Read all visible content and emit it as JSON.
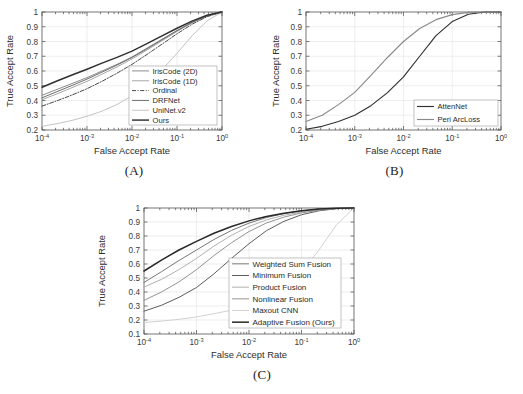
{
  "figure": {
    "name": "roc-curve-figure",
    "background": "#ffffff",
    "panel_count": 3
  },
  "axes_common": {
    "xlabel": "False Accept Rate",
    "ylabel": "True Accept Rate",
    "xticks": [
      "10-4",
      "10-3",
      "10-2",
      "10-1",
      "100"
    ],
    "xtick_mantissa": [
      "10",
      "10",
      "10",
      "10",
      "10"
    ],
    "xtick_exponent": [
      "-4",
      "-3",
      "-2",
      "-1",
      "0"
    ],
    "xlim": [
      0.0001,
      1
    ],
    "xscale": "log",
    "grid": true
  },
  "panels": [
    {
      "id": "A",
      "caption": "(A)"
    },
    {
      "id": "B",
      "caption": "(B)"
    },
    {
      "id": "C",
      "caption": "(C)"
    }
  ],
  "chart_data": [
    {
      "type": "line",
      "panel": "A",
      "title": "",
      "xlabel": "False Accept Rate",
      "ylabel": "True Accept Rate",
      "xscale": "log",
      "xlim": [
        0.0001,
        1
      ],
      "ylim": [
        0.2,
        1.0
      ],
      "yticks": [
        0.2,
        0.3,
        0.4,
        0.5,
        0.6,
        0.7,
        0.8,
        0.9,
        1
      ],
      "ytick_labels": [
        "0.2",
        "0.3",
        "0.4",
        "0.5",
        "0.6",
        "0.7",
        "0.8",
        "0.9",
        "1"
      ],
      "grid": true,
      "legend_position": "lower-right",
      "x": [
        0.0001,
        0.000215,
        0.000464,
        0.001,
        0.00215,
        0.00464,
        0.01,
        0.0215,
        0.0464,
        0.1,
        0.215,
        0.464,
        1.0
      ],
      "series": [
        {
          "name": "IrisCode (2D)",
          "color": "#8c8c8c",
          "dash": "none",
          "width": 1.0,
          "values": [
            0.435,
            0.475,
            0.515,
            0.555,
            0.6,
            0.645,
            0.695,
            0.755,
            0.815,
            0.875,
            0.93,
            0.975,
            1.0
          ]
        },
        {
          "name": "IrisCode (1D)",
          "color": "#a8a8a8",
          "dash": "none",
          "width": 1.0,
          "values": [
            0.405,
            0.445,
            0.487,
            0.53,
            0.578,
            0.628,
            0.682,
            0.742,
            0.805,
            0.868,
            0.927,
            0.973,
            1.0
          ]
        },
        {
          "name": "Ordinal",
          "color": "#4a4a4a",
          "dash": "dashdot",
          "width": 1.0,
          "values": [
            0.362,
            0.398,
            0.437,
            0.48,
            0.53,
            0.585,
            0.645,
            0.712,
            0.782,
            0.852,
            0.917,
            0.968,
            1.0
          ]
        },
        {
          "name": "DRFNet",
          "color": "#6e6e6e",
          "dash": "none",
          "width": 1.0,
          "values": [
            0.418,
            0.46,
            0.502,
            0.545,
            0.592,
            0.64,
            0.692,
            0.75,
            0.812,
            0.873,
            0.929,
            0.974,
            1.0
          ]
        },
        {
          "name": "UniNet.v2",
          "color": "#c4c4c4",
          "dash": "none",
          "width": 1.0,
          "values": [
            0.225,
            0.243,
            0.265,
            0.293,
            0.328,
            0.373,
            0.432,
            0.51,
            0.608,
            0.72,
            0.838,
            0.94,
            1.0
          ]
        },
        {
          "name": "Ours",
          "color": "#303030",
          "dash": "none",
          "width": 1.45,
          "values": [
            0.49,
            0.532,
            0.573,
            0.612,
            0.653,
            0.692,
            0.735,
            0.785,
            0.838,
            0.89,
            0.938,
            0.978,
            1.0
          ]
        }
      ]
    },
    {
      "type": "line",
      "panel": "B",
      "title": "",
      "xlabel": "False Accept Rate",
      "ylabel": "True Accept Rate",
      "xscale": "log",
      "xlim": [
        0.0001,
        1
      ],
      "ylim": [
        0.2,
        1.0
      ],
      "yticks": [
        0.2,
        0.3,
        0.4,
        0.5,
        0.6,
        0.7,
        0.8,
        0.9,
        1
      ],
      "ytick_labels": [
        "0.2",
        "0.3",
        "0.4",
        "0.5",
        "0.6",
        "0.7",
        "0.8",
        "0.9",
        "1"
      ],
      "grid": true,
      "legend_position": "lower-right",
      "x": [
        0.0001,
        0.000215,
        0.000464,
        0.001,
        0.00215,
        0.00464,
        0.01,
        0.0215,
        0.0464,
        0.1,
        0.215,
        0.464,
        1.0
      ],
      "series": [
        {
          "name": "AttenNet",
          "color": "#303030",
          "dash": "none",
          "width": 1.15,
          "values": [
            0.205,
            0.225,
            0.258,
            0.3,
            0.365,
            0.452,
            0.56,
            0.7,
            0.84,
            0.935,
            0.985,
            1.0,
            1.0
          ]
        },
        {
          "name": "Peri ArcLoss",
          "color": "#8a8a8a",
          "dash": "none",
          "width": 1.15,
          "values": [
            0.258,
            0.3,
            0.372,
            0.455,
            0.57,
            0.69,
            0.8,
            0.888,
            0.948,
            0.982,
            0.997,
            1.0,
            1.0
          ]
        }
      ]
    },
    {
      "type": "line",
      "panel": "C",
      "title": "",
      "xlabel": "False Accept Rate",
      "ylabel": "True Accept Rate",
      "xscale": "log",
      "xlim": [
        0.0001,
        1
      ],
      "ylim": [
        0.1,
        1.0
      ],
      "yticks": [
        0.1,
        0.2,
        0.3,
        0.4,
        0.5,
        0.6,
        0.7,
        0.8,
        0.9,
        1
      ],
      "ytick_labels": [
        "0.1",
        "0.2",
        "0.3",
        "0.4",
        "0.5",
        "0.6",
        "0.7",
        "0.8",
        "0.9",
        "1"
      ],
      "grid": true,
      "legend_position": "lower-right",
      "x": [
        0.0001,
        0.000215,
        0.000464,
        0.001,
        0.00215,
        0.00464,
        0.01,
        0.0215,
        0.0464,
        0.1,
        0.215,
        0.464,
        1.0
      ],
      "series": [
        {
          "name": "Weighted Sum Fusion",
          "color": "#777777",
          "dash": "none",
          "width": 1.0,
          "values": [
            0.468,
            0.545,
            0.625,
            0.7,
            0.775,
            0.84,
            0.892,
            0.932,
            0.96,
            0.98,
            0.992,
            0.998,
            1.0
          ]
        },
        {
          "name": "Minimum Fusion",
          "color": "#5d5d5d",
          "dash": "none",
          "width": 1.0,
          "values": [
            0.263,
            0.305,
            0.362,
            0.432,
            0.53,
            0.64,
            0.745,
            0.838,
            0.905,
            0.952,
            0.98,
            0.995,
            1.0
          ]
        },
        {
          "name": "Product Fusion",
          "color": "#b0b0b0",
          "dash": "none",
          "width": 1.0,
          "values": [
            0.435,
            0.49,
            0.56,
            0.64,
            0.728,
            0.805,
            0.868,
            0.915,
            0.948,
            0.972,
            0.988,
            0.997,
            1.0
          ]
        },
        {
          "name": "Nonlinear Fusion",
          "color": "#949494",
          "dash": "none",
          "width": 1.0,
          "values": [
            0.34,
            0.4,
            0.472,
            0.56,
            0.66,
            0.752,
            0.832,
            0.893,
            0.935,
            0.965,
            0.984,
            0.996,
            1.0
          ]
        },
        {
          "name": "Maxout CNN",
          "color": "#d2d2d2",
          "dash": "none",
          "width": 1.0,
          "values": [
            0.182,
            0.192,
            0.205,
            0.222,
            0.245,
            0.27,
            0.3,
            0.345,
            0.42,
            0.54,
            0.7,
            0.88,
            1.0
          ]
        },
        {
          "name": "Adaptive Fusion (Ours)",
          "color": "#282828",
          "dash": "none",
          "width": 1.5,
          "values": [
            0.55,
            0.628,
            0.7,
            0.762,
            0.82,
            0.868,
            0.908,
            0.94,
            0.963,
            0.98,
            0.992,
            0.998,
            1.0
          ]
        }
      ]
    }
  ]
}
